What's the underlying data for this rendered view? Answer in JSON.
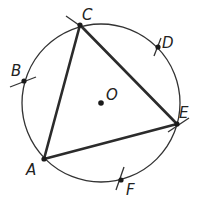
{
  "diagram": {
    "circle": {
      "center_label": "O"
    },
    "points": [
      {
        "id": "A",
        "label": "A",
        "role": "triangle-vertex"
      },
      {
        "id": "B",
        "label": "B",
        "role": "arc-mark"
      },
      {
        "id": "C",
        "label": "C",
        "role": "triangle-vertex"
      },
      {
        "id": "D",
        "label": "D",
        "role": "arc-mark"
      },
      {
        "id": "E",
        "label": "E",
        "role": "triangle-vertex"
      },
      {
        "id": "F",
        "label": "F",
        "role": "arc-mark"
      },
      {
        "id": "O",
        "label": "O",
        "role": "center"
      }
    ],
    "segments": [
      {
        "from": "A",
        "to": "C"
      },
      {
        "from": "C",
        "to": "E"
      },
      {
        "from": "E",
        "to": "A"
      }
    ],
    "colors": {
      "stroke": "#2b2b2b",
      "background": "#ffffff"
    }
  }
}
